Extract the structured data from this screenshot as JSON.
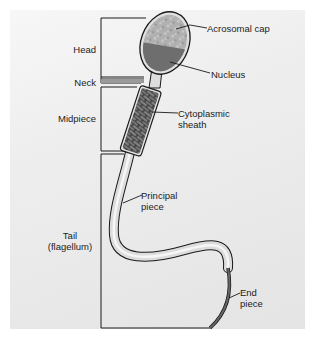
{
  "diagram": {
    "regions": [
      {
        "id": "head",
        "label": "Head"
      },
      {
        "id": "neck",
        "label": "Neck"
      },
      {
        "id": "midpiece",
        "label": "Midpiece"
      },
      {
        "id": "tail",
        "label_line1": "Tail",
        "label_line2": "(flagellum)"
      }
    ],
    "callouts": [
      {
        "id": "acrosomal-cap",
        "label": "Acrosomal cap"
      },
      {
        "id": "nucleus",
        "label": "Nucleus"
      },
      {
        "id": "cytoplasmic-sheath",
        "label_line1": "Cytoplasmic",
        "label_line2": "sheath"
      },
      {
        "id": "principal-piece",
        "label_line1": "Principal",
        "label_line2": "piece"
      },
      {
        "id": "end-piece",
        "label_line1": "End",
        "label_line2": "piece"
      }
    ],
    "colors": {
      "background": "#ebebeb",
      "outline": "#1a1a1a",
      "acrosome": "#a8a8a8",
      "nucleus": "#6e6e6e",
      "sheath_brick": "#7a7a7a",
      "tail_fill": "#dcdcdc",
      "end_piece": "#555555"
    }
  }
}
